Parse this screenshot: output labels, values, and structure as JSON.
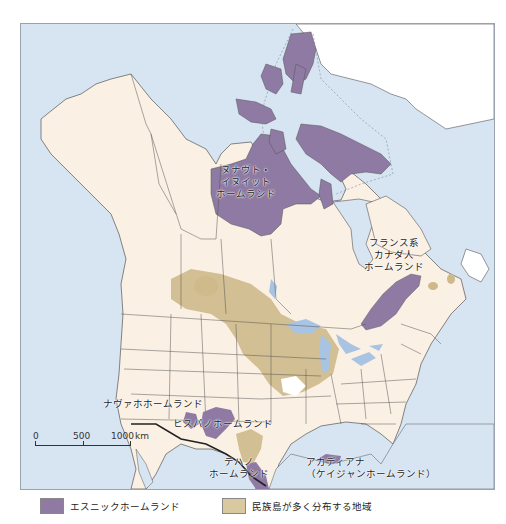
{
  "map": {
    "colors": {
      "ocean": "#d7e4f2",
      "land": "#fbf0e4",
      "greenland": "#ffffff",
      "ethnic_homeland": "#8e7aa3",
      "ethnic_islands": "#cdb98a",
      "lakes": "#a9c4e2",
      "borders": "#555555",
      "international_border": "#222222"
    },
    "labels": {
      "nunavut": [
        "ヌナヴト・",
        "イヌイット",
        "ホームランド"
      ],
      "french_canadian": [
        "フランス系",
        "カナダ人",
        "ホームランド"
      ],
      "navajo": "ナヴァホホームランド",
      "hispano": "ヒスパノホームランド",
      "tejano": [
        "テハノ",
        "ホームランド"
      ],
      "acadiana": [
        "アカディアナ",
        "（ケイジャンホームランド）"
      ]
    },
    "scale": {
      "ticks": [
        "0",
        "500",
        "1000"
      ],
      "unit": "km"
    }
  },
  "legend": {
    "items": [
      {
        "label": "エスニックホームランド",
        "color": "#8e7aa3"
      },
      {
        "label": "民族島が多く分布する地域",
        "color": "#d9c9a0"
      }
    ]
  }
}
